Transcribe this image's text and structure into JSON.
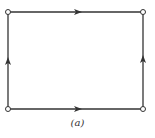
{
  "diagram": {
    "caption": "(a)",
    "colors": {
      "line": "#333333",
      "node_fill": "#ffffff",
      "background": "#ffffff"
    },
    "nodes": [
      {
        "id": "top-left",
        "x": 8,
        "y": 12
      },
      {
        "id": "top-right",
        "x": 143,
        "y": 12
      },
      {
        "id": "bottom-left",
        "x": 8,
        "y": 109
      },
      {
        "id": "bottom-right",
        "x": 143,
        "y": 109
      }
    ],
    "edges": [
      {
        "from": "top-left",
        "to": "top-right",
        "direction": "right"
      },
      {
        "from": "bottom-left",
        "to": "bottom-right",
        "direction": "right"
      },
      {
        "from": "bottom-left",
        "to": "top-left",
        "direction": "up"
      },
      {
        "from": "bottom-right",
        "to": "top-right",
        "direction": "up"
      }
    ]
  }
}
